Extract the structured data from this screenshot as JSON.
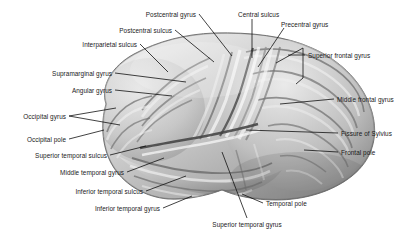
{
  "figure": {
    "background_color": "#ffffff",
    "ink_color": "#1a1a1a",
    "leader_color": "#111111"
  },
  "labels": [
    {
      "id": "postcentral-gyrus",
      "text": "Postcentral gyrus",
      "tx": 196,
      "ty": 14,
      "align": "r",
      "lx": 199,
      "ly": 14,
      "ex": 232,
      "ey": 56
    },
    {
      "id": "central-sulcus",
      "text": "Central sulcus",
      "tx": 238,
      "ty": 14,
      "align": "l",
      "lx": 252,
      "ly": 19,
      "ex": 252,
      "ey": 58
    },
    {
      "id": "precentral-gyrus",
      "text": "Precentral gyrus",
      "tx": 281,
      "ty": 24,
      "align": "l",
      "lx": 284,
      "ly": 28,
      "ex": 258,
      "ey": 67
    },
    {
      "id": "postcentral-sulcus",
      "text": "Postcentral sulcus",
      "tx": 172,
      "ty": 30,
      "align": "r",
      "lx": 175,
      "ly": 30,
      "ex": 214,
      "ey": 62
    },
    {
      "id": "interparietal-sulcus",
      "text": "Interparietal sulcus",
      "tx": 137,
      "ty": 44,
      "align": "r",
      "lx": 140,
      "ly": 44,
      "ex": 168,
      "ey": 72
    },
    {
      "id": "superior-frontal-gyrus",
      "text": "Superior frontal gyrus",
      "tx": 308,
      "ty": 55,
      "align": "l",
      "lx": 305,
      "ly": 55,
      "ex": 288,
      "ey": 55,
      "bracket": {
        "x": 303,
        "y1": 48,
        "y2": 78,
        "ax": 276,
        "ay1": 63,
        "ax2": 296,
        "ay2": 84
      }
    },
    {
      "id": "supramarginal-gyrus",
      "text": "Supramarginal gyrus",
      "tx": 112,
      "ty": 73,
      "align": "r",
      "lx": 115,
      "ly": 73,
      "ex": 186,
      "ey": 82
    },
    {
      "id": "angular-gyrus",
      "text": "Angular gyrus",
      "tx": 112,
      "ty": 90,
      "align": "r",
      "lx": 115,
      "ly": 90,
      "ex": 172,
      "ey": 96
    },
    {
      "id": "middle-frontal-gyrus",
      "text": "Middle frontal gyrus",
      "tx": 337,
      "ty": 99,
      "align": "l",
      "lx": 334,
      "ly": 99,
      "ex": 280,
      "ey": 104
    },
    {
      "id": "occipital-gyrus",
      "text": "Occipital gyrus",
      "tx": 66,
      "ty": 116,
      "align": "r",
      "lx": 69,
      "ly": 116,
      "ex": 116,
      "ey": 108,
      "ex2": 120,
      "ey2": 125
    },
    {
      "id": "occipital-pole",
      "text": "Occipital pole",
      "tx": 66,
      "ty": 139,
      "align": "r",
      "lx": 69,
      "ly": 139,
      "ex": 104,
      "ey": 130
    },
    {
      "id": "fissure-of-sylvius",
      "text": "Fissure of Sylvius",
      "tx": 341,
      "ty": 133,
      "align": "l",
      "lx": 338,
      "ly": 133,
      "ex": 246,
      "ey": 130
    },
    {
      "id": "superior-temporal-sulcus",
      "text": "Superior temporal sulcus",
      "tx": 107,
      "ty": 155,
      "align": "r",
      "lx": 110,
      "ly": 155,
      "ex": 146,
      "ey": 146
    },
    {
      "id": "frontal-pole",
      "text": "Frontal pole",
      "tx": 341,
      "ty": 152,
      "align": "l",
      "lx": 338,
      "ly": 152,
      "ex": 304,
      "ey": 150
    },
    {
      "id": "middle-temporal-gyrus",
      "text": "Middle temporal gyrus",
      "tx": 124,
      "ty": 172,
      "align": "r",
      "lx": 127,
      "ly": 172,
      "ex": 164,
      "ey": 158
    },
    {
      "id": "inferior-temporal-sulcus",
      "text": "Inferior temporal sulcus",
      "tx": 143,
      "ty": 191,
      "align": "r",
      "lx": 146,
      "ly": 191,
      "ex": 186,
      "ey": 176
    },
    {
      "id": "temporal-pole",
      "text": "Temporal pole",
      "tx": 266,
      "ty": 203,
      "align": "l",
      "lx": 263,
      "ly": 203,
      "ex": 242,
      "ey": 194
    },
    {
      "id": "inferior-temporal-gyrus",
      "text": "Inferior temporal gyrus",
      "tx": 160,
      "ty": 208,
      "align": "r",
      "lx": 163,
      "ly": 208,
      "ex": 192,
      "ey": 196
    },
    {
      "id": "superior-temporal-gyrus",
      "text": "Superior temporal gyrus",
      "tx": 247,
      "ty": 224,
      "align": "c",
      "lx": 247,
      "ly": 218,
      "ex": 222,
      "ey": 152
    }
  ]
}
